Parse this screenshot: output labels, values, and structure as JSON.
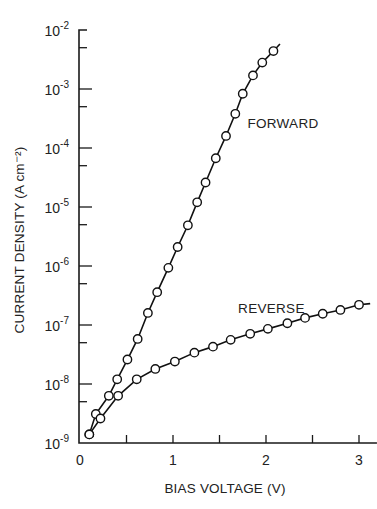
{
  "chart_data": {
    "type": "line",
    "title": "",
    "xlabel": "BIAS VOLTAGE (V)",
    "ylabel": "CURRENT DENSITY (A cm⁻²)",
    "xlim": [
      0,
      3.15
    ],
    "ylim": [
      1e-09,
      0.01
    ],
    "yscale": "log",
    "grid": false,
    "legend": "none",
    "x_ticks": [
      {
        "value": 0,
        "label": "0"
      },
      {
        "value": 0.5,
        "label": ""
      },
      {
        "value": 1,
        "label": "1"
      },
      {
        "value": 1.5,
        "label": ""
      },
      {
        "value": 2,
        "label": "2"
      },
      {
        "value": 2.5,
        "label": ""
      },
      {
        "value": 3,
        "label": "3"
      }
    ],
    "y_ticks": [
      {
        "exp": -9,
        "base": "10",
        "sup": "-9"
      },
      {
        "exp": -8,
        "base": "10",
        "sup": "-8"
      },
      {
        "exp": -7,
        "base": "10",
        "sup": "-7"
      },
      {
        "exp": -6,
        "base": "10",
        "sup": "-6"
      },
      {
        "exp": -5,
        "base": "10",
        "sup": "-5"
      },
      {
        "exp": -4,
        "base": "10",
        "sup": "-4"
      },
      {
        "exp": -3,
        "base": "10",
        "sup": "-3"
      },
      {
        "exp": -2,
        "base": "10",
        "sup": "-2"
      }
    ],
    "series": [
      {
        "name": "FORWARD",
        "label_anchor": {
          "x": 1.8,
          "y": 0.00022
        },
        "x": [
          0.1,
          0.17,
          0.31,
          0.4,
          0.51,
          0.62,
          0.73,
          0.83,
          0.95,
          1.05,
          1.16,
          1.26,
          1.35,
          1.46,
          1.57,
          1.67,
          1.75,
          1.86,
          1.96,
          2.08
        ],
        "y": [
          1.4e-09,
          3.1e-09,
          6.3e-09,
          1.2e-08,
          2.6e-08,
          5.8e-08,
          1.6e-07,
          3.6e-07,
          9.3e-07,
          2.1e-06,
          4.9e-06,
          1.2e-05,
          2.6e-05,
          6.7e-05,
          0.00016,
          0.00038,
          0.00083,
          0.0017,
          0.0028,
          0.0044
        ],
        "line_end": {
          "x": 2.15,
          "y": 0.0058
        }
      },
      {
        "name": "REVERSE",
        "label_anchor": {
          "x": 1.7,
          "y": 1.6e-07
        },
        "x": [
          0.1,
          0.22,
          0.41,
          0.61,
          0.81,
          1.02,
          1.23,
          1.43,
          1.62,
          1.83,
          2.02,
          2.23,
          2.42,
          2.61,
          2.8,
          3.0
        ],
        "y": [
          1.4e-09,
          2.6e-09,
          6.3e-09,
          1.2e-08,
          1.8e-08,
          2.4e-08,
          3.4e-08,
          4.3e-08,
          5.6e-08,
          7.1e-08,
          8.6e-08,
          1.07e-07,
          1.32e-07,
          1.55e-07,
          1.8e-07,
          2.2e-07
        ],
        "line_end": {
          "x": 3.12,
          "y": 2.3e-07
        }
      }
    ]
  }
}
